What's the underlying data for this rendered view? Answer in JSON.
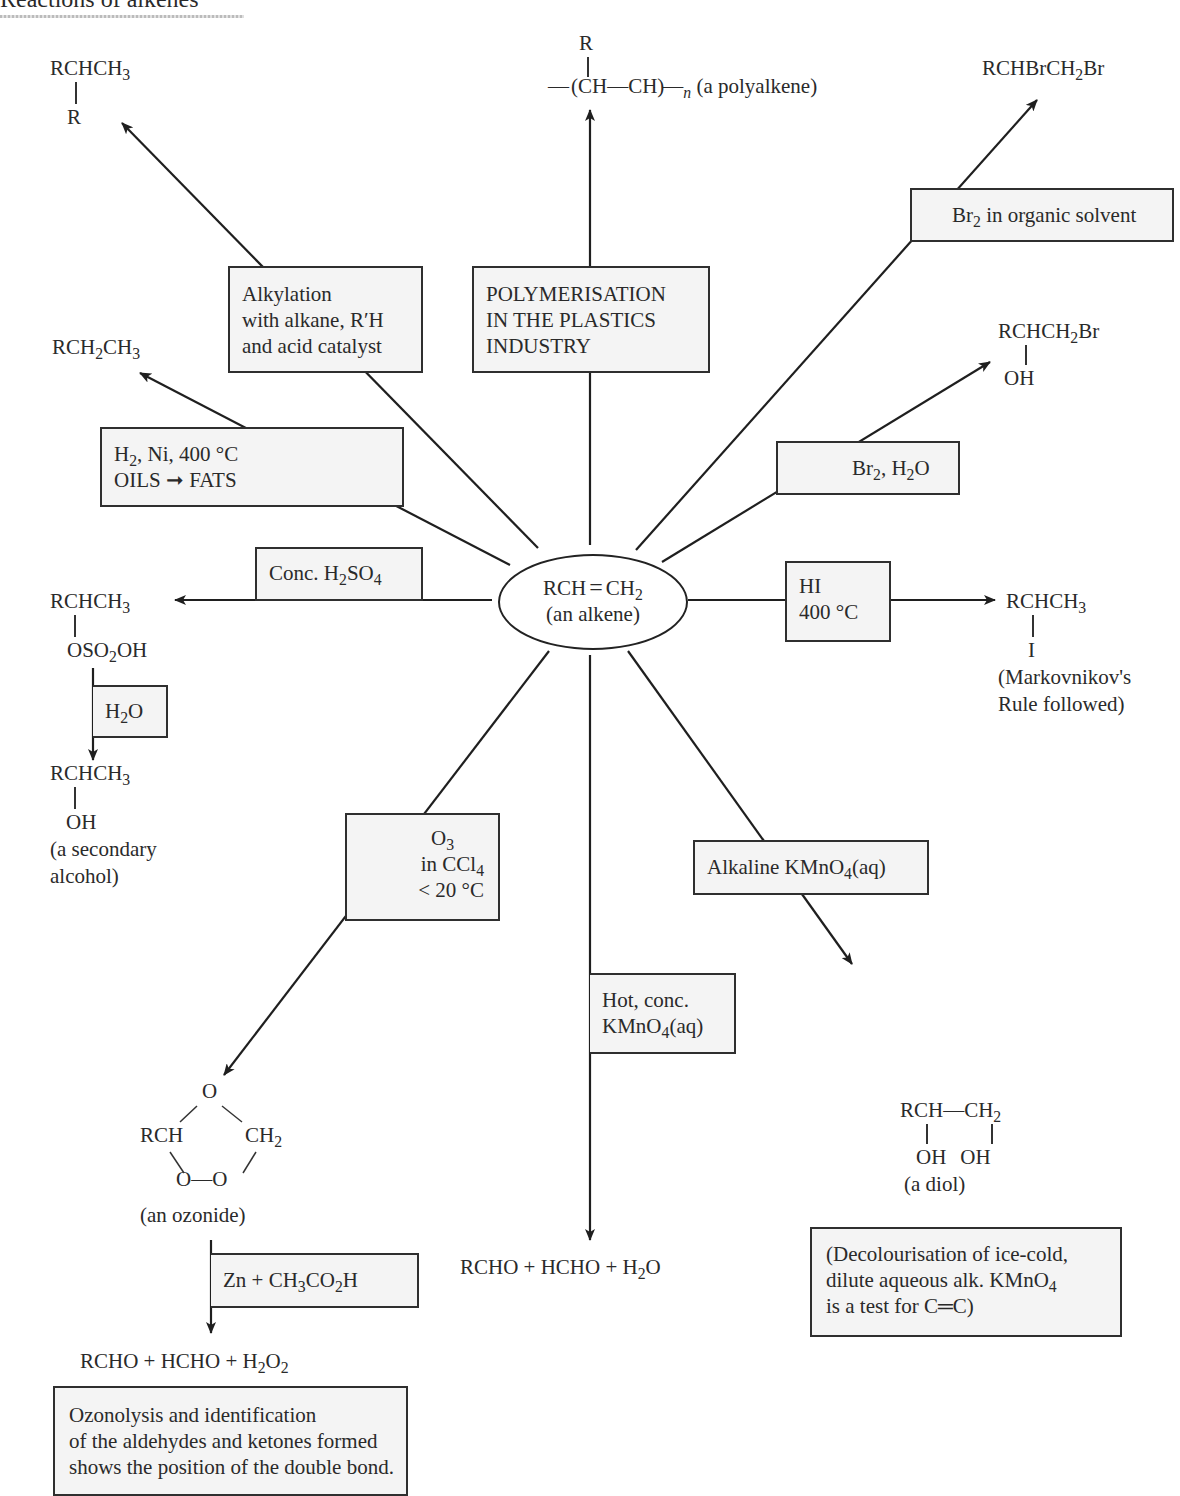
{
  "title": "Reactions of alkenes",
  "center": {
    "formula_left": "RCH",
    "double_bond": "=",
    "formula_right": "CH",
    "formula_right_sub": "2",
    "caption": "(an alkene)"
  },
  "products": {
    "alkylation": {
      "main": "RCHCH",
      "sub": "3",
      "branch": "R"
    },
    "polymer": {
      "branch": "R",
      "chain": "(CH—CH)",
      "n": "n",
      "caption": "(a polyalkene)"
    },
    "dibromide": {
      "p1": "RCHBrCH",
      "sub": "2",
      "p2": "Br"
    },
    "hydrogenation": {
      "p1": "RCH",
      "sub1": "2",
      "p2": "CH",
      "sub2": "3"
    },
    "bromohydrin": {
      "p1": "RCHCH",
      "sub": "2",
      "p2": "Br",
      "branch": "OH"
    },
    "sulfate": {
      "main": "RCHCH",
      "sub": "3",
      "b1": "OSO",
      "bsub": "2",
      "b2": "OH"
    },
    "alcohol": {
      "main": "RCHCH",
      "sub": "3",
      "branch": "OH",
      "caption1": "(a secondary",
      "caption2": "alcohol)"
    },
    "iodide": {
      "main": "RCHCH",
      "sub": "3",
      "branch": "I",
      "caption1": "(Markovnikov's",
      "caption2": "Rule followed)"
    },
    "ozonide": {
      "top": "O",
      "left": "RCH",
      "right": "CH",
      "right_sub": "2",
      "bottom": "O—O",
      "caption": "(an ozonide)"
    },
    "cleavage": {
      "p1": "RCHO + HCHO + H",
      "sub": "2",
      "p2": "O"
    },
    "diol": {
      "p1": "RCH—CH",
      "sub": "2",
      "oh1": "OH",
      "oh2": "OH",
      "caption": "(a diol)"
    },
    "ozonolysis": {
      "p1": "RCHO + HCHO + H",
      "sub1": "2",
      "p2": "O",
      "sub2": "2"
    }
  },
  "conditions": {
    "alkylation": [
      "Alkylation",
      "with alkane, R′H",
      "and acid catalyst"
    ],
    "polymerisation": [
      "POLYMERISATION",
      "IN THE PLASTICS",
      "INDUSTRY"
    ],
    "bromine_organic": {
      "p1": "Br",
      "sub": "2",
      "p2": " in organic solvent"
    },
    "hydrogenation": {
      "l1a": "H",
      "l1sub": "2",
      "l1b": ", Ni, 400 °C",
      "l2": "OILS ➞ FATS"
    },
    "bromine_water": {
      "p1": "Br",
      "sub1": "2",
      "p2": ", H",
      "sub2": "2",
      "p3": "O"
    },
    "sulfuric": {
      "p1": "Conc. H",
      "sub1": "2",
      "p2": "SO",
      "sub2": "4"
    },
    "hi": [
      "HI",
      "400 °C"
    ],
    "water": {
      "p1": "H",
      "sub": "2",
      "p2": "O"
    },
    "ozone": {
      "l1": "O",
      "l1sub": "3",
      "l2": "in CCl",
      "l2sub": "4",
      "l3": "< 20 °C"
    },
    "alk_kmno4": {
      "p1": "Alkaline KMnO",
      "sub": "4",
      "p2": "(aq)"
    },
    "hot_kmno4": {
      "l1": "Hot, conc.",
      "l2a": "KMnO",
      "l2sub": "4",
      "l2b": "(aq)"
    },
    "zinc": {
      "p1": "Zn + CH",
      "sub1": "3",
      "p2": "CO",
      "sub2": "2",
      "p3": "H"
    }
  },
  "notes": {
    "decolourisation": {
      "l1": "(Decolourisation of ice-cold,",
      "l2a": "dilute aqueous alk. KMnO",
      "l2sub": "4",
      "l3": "is a test for C═C)"
    },
    "ozonolysis": [
      "Ozonolysis and identification",
      "of the aldehydes and ketones formed",
      "shows the position of the double bond."
    ]
  },
  "colors": {
    "line": "#1f1f1f",
    "box_fill": "#f4f4f4",
    "text": "#2a2a2a"
  }
}
